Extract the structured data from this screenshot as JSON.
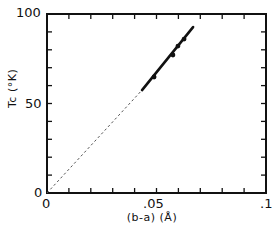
{
  "chart_data": {
    "type": "line",
    "title": "",
    "xlabel": "(b-a) (Å)",
    "ylabel": "Tc (°K)",
    "xlim": [
      0,
      0.1
    ],
    "ylim": [
      0,
      100
    ],
    "x_ticks": [
      "0",
      ".05",
      ".1"
    ],
    "y_ticks": [
      "0",
      "50",
      "100"
    ],
    "grid": false,
    "legend": null,
    "series": [
      {
        "name": "measured (solid fit)",
        "style": "solid",
        "x": [
          0.0434,
          0.0667
        ],
        "y": [
          57.5,
          92.7
        ]
      },
      {
        "name": "extrapolation",
        "style": "dashed",
        "x": [
          0.0,
          0.0434
        ],
        "y": [
          0.0,
          57.5
        ]
      },
      {
        "name": "data points",
        "style": "markers",
        "x": [
          0.0489,
          0.0575,
          0.0598,
          0.0626
        ],
        "y": [
          64.8,
          77.1,
          82.1,
          86.0
        ]
      }
    ]
  },
  "labels": {
    "y100": "100",
    "y50": "50",
    "y0": "0",
    "x0": "0",
    "x05": ".05",
    "x1": ".1",
    "xlabel": "(b-a) (Å)",
    "ylabel": "Tc (°K)"
  }
}
